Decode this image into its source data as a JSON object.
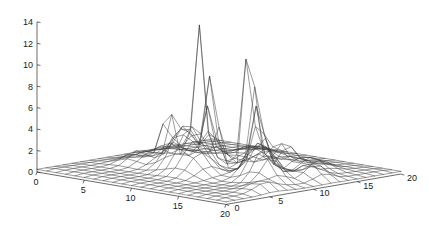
{
  "figure": {
    "title": "",
    "background_color": "#ffffff",
    "line_color": "#3a3a3a",
    "axis_color": "#2b2b2b",
    "text_color": "#1a1a1a"
  },
  "chart_data": {
    "type": "surface",
    "render": "wireframe-mesh",
    "title": "",
    "xlabel": "",
    "ylabel": "",
    "zlabel": "",
    "xlim": [
      0,
      20
    ],
    "ylim": [
      0,
      20
    ],
    "zlim": [
      0,
      14
    ],
    "xticks": [
      0,
      5,
      10,
      15,
      20
    ],
    "yticks": [
      0,
      5,
      10,
      15,
      20
    ],
    "zticks": [
      0,
      2,
      4,
      6,
      8,
      10,
      12,
      14
    ],
    "xtick_labels": [
      "0",
      "5",
      "10",
      "15",
      "20"
    ],
    "ytick_labels": [
      "0",
      "5",
      "10",
      "15",
      "20"
    ],
    "ztick_labels": [
      "0",
      "2",
      "4",
      "6",
      "8",
      "10",
      "12",
      "14"
    ],
    "grid": false,
    "legend": "none",
    "grid_nx": 21,
    "grid_ny": 21,
    "view": {
      "azimuth_deg": -37.5,
      "elevation_deg": 18,
      "projection": "orthographic"
    },
    "base_level": 0.35,
    "features": [
      {
        "kind": "spike",
        "x": 7.0,
        "y": 11.0,
        "height": 12.7,
        "sigma": 0.55
      },
      {
        "kind": "spike",
        "x": 9.3,
        "y": 10.2,
        "height": 9.6,
        "sigma": 0.5
      },
      {
        "kind": "spike",
        "x": 11.2,
        "y": 12.4,
        "height": 14.1,
        "sigma": 0.55
      },
      {
        "kind": "spike",
        "x": 5.3,
        "y": 9.6,
        "height": 6.0,
        "sigma": 0.6
      },
      {
        "kind": "spike",
        "x": 13.2,
        "y": 11.0,
        "height": 6.3,
        "sigma": 0.6
      },
      {
        "kind": "spike",
        "x": 6.2,
        "y": 13.0,
        "height": 5.2,
        "sigma": 0.55
      },
      {
        "kind": "bump",
        "x": 8.4,
        "y": 8.0,
        "height": 4.1,
        "sigma": 1.3
      },
      {
        "kind": "bump",
        "x": 14.9,
        "y": 9.4,
        "height": 3.1,
        "sigma": 1.1
      },
      {
        "kind": "bump",
        "x": 16.6,
        "y": 8.2,
        "height": 2.2,
        "sigma": 1.0
      },
      {
        "kind": "bump",
        "x": 10.6,
        "y": 6.6,
        "height": 1.9,
        "sigma": 1.2
      },
      {
        "kind": "bump",
        "x": 4.2,
        "y": 7.3,
        "height": 1.3,
        "sigma": 1.1
      },
      {
        "kind": "bump",
        "x": 12.4,
        "y": 14.6,
        "height": 2.4,
        "sigma": 0.9
      },
      {
        "kind": "bump",
        "x": 17.8,
        "y": 12.2,
        "height": 1.5,
        "sigma": 1.0
      },
      {
        "kind": "bump",
        "x": 3.0,
        "y": 12.0,
        "height": 1.1,
        "sigma": 1.0
      },
      {
        "kind": "bump",
        "x": 15.4,
        "y": 15.0,
        "height": 1.2,
        "sigma": 1.1
      },
      {
        "kind": "bump",
        "x": 7.8,
        "y": 16.4,
        "height": 1.0,
        "sigma": 1.2
      },
      {
        "kind": "bump",
        "x": 19.0,
        "y": 5.6,
        "height": 0.9,
        "sigma": 1.2
      }
    ]
  },
  "axes": {
    "z_axis_name": "vertical-value-axis",
    "x_axis_name": "front-left-axis",
    "y_axis_name": "front-right-axis"
  }
}
